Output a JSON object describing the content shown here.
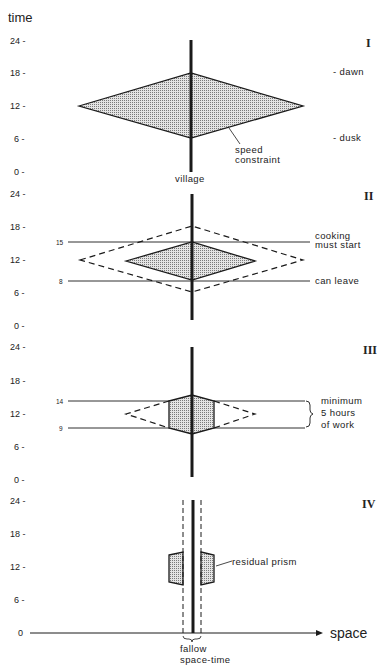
{
  "axis": {
    "y_title": "time",
    "x_title": "space",
    "ticks": [
      "24 -",
      "18 -",
      "12 -",
      "6 -",
      "0 -"
    ],
    "baseline_tick": "0"
  },
  "panels": [
    {
      "id": "I",
      "label": "I",
      "annotations": {
        "dawn": "- dawn",
        "dusk": "- dusk",
        "speed_1": "speed",
        "speed_2": "constraint",
        "village": "village"
      }
    },
    {
      "id": "II",
      "label": "II",
      "line_labels": {
        "upper": "15",
        "lower": "8"
      },
      "annotations": {
        "cooking_1": "cooking",
        "cooking_2": "must start",
        "leave": "can leave"
      }
    },
    {
      "id": "III",
      "label": "III",
      "line_labels": {
        "upper": "14",
        "lower": "9"
      },
      "annotations": {
        "work_1": "minimum",
        "work_2": "5 hours",
        "work_3": "of work"
      }
    },
    {
      "id": "IV",
      "label": "IV",
      "annotations": {
        "residual": "residual prism",
        "fallow_1": "fallow",
        "fallow_2": "space-time"
      }
    }
  ],
  "colors": {
    "ink": "#1a1a1a",
    "fill": "#bdbdbd",
    "background": "#ffffff"
  }
}
